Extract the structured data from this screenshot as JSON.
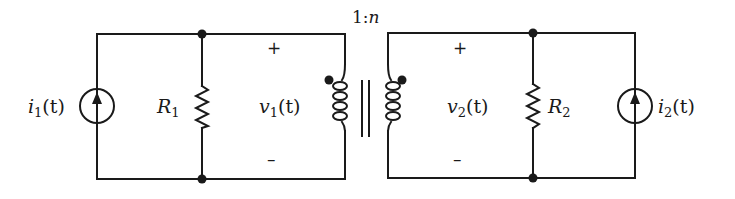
{
  "diagram": {
    "type": "circuit",
    "colors": {
      "ink": "#1a1a1a",
      "background": "#ffffff"
    },
    "transformer": {
      "ratio_label": "1:n",
      "ratio_prefix": "1:",
      "ratio_n": "n",
      "dot_convention": "dots on top of both windings"
    },
    "left": {
      "source": {
        "label": "i",
        "subscript": "1",
        "arg": "(t)",
        "icon": "current-source-arrow-up"
      },
      "resistor": {
        "label": "R",
        "subscript": "1"
      },
      "voltage": {
        "label": "v",
        "subscript": "1",
        "arg": "(t)",
        "plus": "+",
        "minus": "–"
      }
    },
    "right": {
      "source": {
        "label": "i",
        "subscript": "2",
        "arg": "(t)",
        "icon": "current-source-arrow-up"
      },
      "resistor": {
        "label": "R",
        "subscript": "2"
      },
      "voltage": {
        "label": "v",
        "subscript": "2",
        "arg": "(t)",
        "plus": "+",
        "minus": "–"
      }
    }
  }
}
